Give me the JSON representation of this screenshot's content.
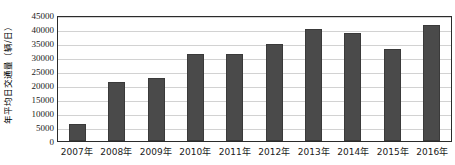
{
  "chart_data": {
    "type": "bar",
    "title": "",
    "xlabel": "",
    "ylabel": "年平均日交通量（辆/日）",
    "categories": [
      "2007年",
      "2008年",
      "2009年",
      "2010年",
      "2011年",
      "2012年",
      "2013年",
      "2014年",
      "2015年",
      "2016年"
    ],
    "values": [
      6000,
      21000,
      22500,
      31000,
      31000,
      34500,
      40000,
      38500,
      33000,
      41500
    ],
    "ylim": [
      0,
      45000
    ],
    "ytick_step": 5000,
    "yticks": [
      0,
      5000,
      10000,
      15000,
      20000,
      25000,
      30000,
      35000,
      40000,
      45000
    ],
    "ytick_labels": [
      "0",
      "5000",
      "10000",
      "15000",
      "20000",
      "25000",
      "30000",
      "35000",
      "40000",
      "45000"
    ],
    "grid": true,
    "legend": false,
    "legend_position": "none",
    "series": [
      {
        "name": "年平均日交通量",
        "values": [
          6000,
          21000,
          22500,
          31000,
          31000,
          34500,
          40000,
          38500,
          33000,
          41500
        ]
      }
    ]
  },
  "colors": {
    "bar_fill": "#4a4a4a",
    "bar_stroke": "#3a3a3a",
    "gridline": "#d2d2d2",
    "axis_border": "#2b2b2b",
    "background": "#ffffff",
    "text": "#1a1a1a"
  }
}
